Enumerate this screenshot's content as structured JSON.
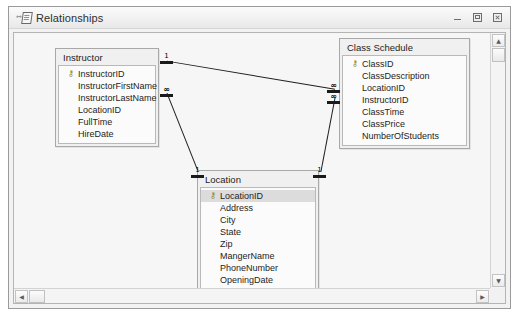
{
  "window": {
    "title": "Relationships",
    "icon": "relationships-icon",
    "buttons": [
      {
        "name": "minimize-button",
        "label": "–"
      },
      {
        "name": "restore-button",
        "label": "❐"
      },
      {
        "name": "close-button",
        "label": "✕"
      }
    ]
  },
  "tables": [
    {
      "name": "Instructor",
      "fields": [
        {
          "label": "InstructorID",
          "key": true,
          "selected": false
        },
        {
          "label": "InstructorFirstName",
          "key": false,
          "selected": false
        },
        {
          "label": "InstructorLastName",
          "key": false,
          "selected": false
        },
        {
          "label": "LocationID",
          "key": false,
          "selected": false
        },
        {
          "label": "FullTime",
          "key": false,
          "selected": false
        },
        {
          "label": "HireDate",
          "key": false,
          "selected": false
        }
      ]
    },
    {
      "name": "Class Schedule",
      "fields": [
        {
          "label": "ClassID",
          "key": true,
          "selected": false
        },
        {
          "label": "ClassDescription",
          "key": false,
          "selected": false
        },
        {
          "label": "LocationID",
          "key": false,
          "selected": false
        },
        {
          "label": "InstructorID",
          "key": false,
          "selected": false
        },
        {
          "label": "ClassTime",
          "key": false,
          "selected": false
        },
        {
          "label": "ClassPrice",
          "key": false,
          "selected": false
        },
        {
          "label": "NumberOfStudents",
          "key": false,
          "selected": false
        }
      ]
    },
    {
      "name": "Location",
      "fields": [
        {
          "label": "LocationID",
          "key": true,
          "selected": true
        },
        {
          "label": "Address",
          "key": false,
          "selected": false
        },
        {
          "label": "City",
          "key": false,
          "selected": false
        },
        {
          "label": "State",
          "key": false,
          "selected": false
        },
        {
          "label": "Zip",
          "key": false,
          "selected": false
        },
        {
          "label": "MangerName",
          "key": false,
          "selected": false
        },
        {
          "label": "PhoneNumber",
          "key": false,
          "selected": false
        },
        {
          "label": "OpeningDate",
          "key": false,
          "selected": false
        }
      ]
    }
  ],
  "relationships": [
    {
      "from": "Instructor",
      "from_side": "one",
      "to": "Class Schedule",
      "to_side": "many"
    },
    {
      "from": "Instructor",
      "from_side": "many",
      "to": "Location",
      "to_side": "one"
    },
    {
      "from": "Location",
      "from_side": "one",
      "to": "Class Schedule",
      "to_side": "many"
    }
  ],
  "cardinality_markers": [
    {
      "name": "instructor-one-marker",
      "label": "1"
    },
    {
      "name": "instructor-many-marker",
      "label": "∞"
    },
    {
      "name": "classschedule-many-marker-1",
      "label": "∞"
    },
    {
      "name": "classschedule-many-marker-2",
      "label": "∞"
    },
    {
      "name": "location-one-marker-left",
      "label": "1"
    },
    {
      "name": "location-one-marker-right",
      "label": "1"
    }
  ],
  "key_glyph": "⚷",
  "scrollbars": {
    "vertical": {
      "up": "▲",
      "down": "▼"
    },
    "horizontal": {
      "left": "◀",
      "right": "▶"
    }
  }
}
